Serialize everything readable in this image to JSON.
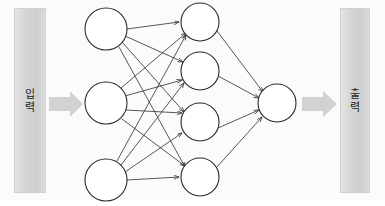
{
  "diagram": {
    "type": "feedforward-neural-network",
    "input_bar": {
      "label": "입력",
      "chars": [
        "입",
        "력"
      ],
      "fill_color": "#d3d3d3",
      "border_color": "#d0d0d0"
    },
    "output_bar": {
      "label": "출력",
      "chars": [
        "출",
        "력"
      ],
      "fill_color": "#d3d3d3",
      "border_color": "#d0d0d0"
    },
    "arrows": {
      "input_arrow_name": "input-block-arrow",
      "output_arrow_name": "output-block-arrow",
      "color": "#d2d2d2"
    },
    "node_style": {
      "fill": "#ffffff",
      "stroke": "#2b2b2b"
    },
    "connection_color": "#3a3a3a",
    "layers": [
      {
        "name": "input-layer",
        "node_count": 3,
        "nodes": [
          {
            "cx": 106,
            "cy": 29,
            "r": 21
          },
          {
            "cx": 106,
            "cy": 103,
            "r": 21
          },
          {
            "cx": 106,
            "cy": 180,
            "r": 21
          }
        ]
      },
      {
        "name": "hidden-layer",
        "node_count": 4,
        "nodes": [
          {
            "cx": 200,
            "cy": 22,
            "r": 19
          },
          {
            "cx": 200,
            "cy": 71,
            "r": 19
          },
          {
            "cx": 200,
            "cy": 122,
            "r": 19
          },
          {
            "cx": 200,
            "cy": 177,
            "r": 19
          }
        ]
      },
      {
        "name": "output-layer",
        "node_count": 1,
        "nodes": [
          {
            "cx": 277,
            "cy": 103,
            "r": 19
          }
        ]
      }
    ],
    "connections": {
      "input_to_hidden_count": 12,
      "hidden_to_output_count": 4,
      "fully_connected": true
    }
  }
}
